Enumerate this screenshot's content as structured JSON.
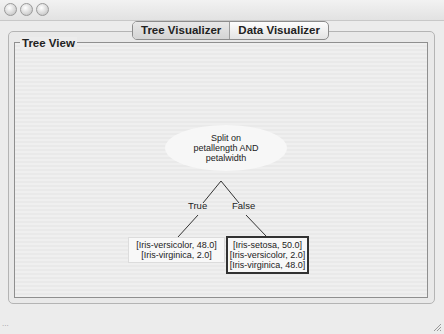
{
  "window": {
    "controls": [
      "close",
      "minimize",
      "zoom"
    ]
  },
  "tabs": [
    {
      "label": "Tree Visualizer",
      "active": true
    },
    {
      "label": "Data Visualizer",
      "active": false
    }
  ],
  "tree_view": {
    "title": "Tree View",
    "root": {
      "lines": [
        "Split on",
        "petallength AND",
        "petalwidth"
      ]
    },
    "edges": [
      {
        "label": "True"
      },
      {
        "label": "False"
      }
    ],
    "leaves": [
      {
        "lines": [
          "[Iris-versicolor, 48.0]",
          "[Iris-virginica, 2.0]"
        ],
        "selected": false
      },
      {
        "lines": [
          "[Iris-setosa, 50.0]",
          "[Iris-versicolor, 2.0]",
          "[Iris-virginica, 48.0]"
        ],
        "selected": true
      }
    ]
  },
  "status": {
    "text": "..."
  }
}
